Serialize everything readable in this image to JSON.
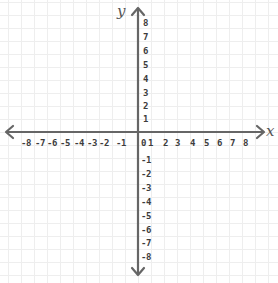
{
  "diagram": {
    "type": "cartesian-coordinate-plane",
    "x_axis": {
      "name": "x",
      "range": [
        -8,
        8
      ],
      "negative_labels": [
        "-8",
        "-7",
        "-6",
        "-5",
        "-4",
        "-3",
        "-2",
        "-1"
      ],
      "origin_label": "0",
      "positive_labels": [
        "1",
        "2",
        "3",
        "4",
        "5",
        "6",
        "7",
        "8"
      ]
    },
    "y_axis": {
      "name": "y",
      "range": [
        -8,
        8
      ],
      "positive_labels": [
        "8",
        "7",
        "6",
        "5",
        "4",
        "3",
        "2",
        "1"
      ],
      "negative_labels": [
        "-1",
        "-2",
        "-3",
        "-4",
        "-5",
        "-6",
        "-7",
        "-8"
      ]
    },
    "colors": {
      "axis": "#666666",
      "grid": "#eeeeee",
      "labels": "#3c3c3c",
      "background": "#ffffff"
    },
    "grid": true,
    "arrows": [
      "left",
      "right",
      "up",
      "down"
    ]
  }
}
